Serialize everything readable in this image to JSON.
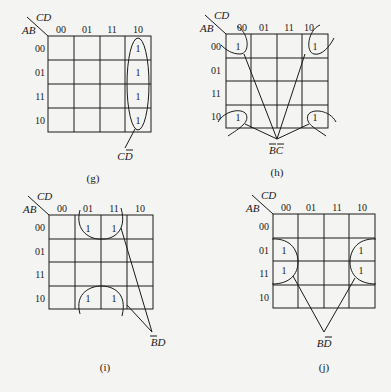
{
  "figure": {
    "maps": [
      {
        "id": "g",
        "caption": "(g)",
        "row_var": "AB",
        "col_var": "CD",
        "col_labels": [
          "00",
          "01",
          "11",
          "10"
        ],
        "row_labels": [
          "00",
          "01",
          "11",
          "10"
        ],
        "cells": [
          [
            0,
            0,
            0,
            1
          ],
          [
            0,
            0,
            0,
            1
          ],
          [
            0,
            0,
            0,
            1
          ],
          [
            0,
            0,
            0,
            1
          ]
        ],
        "one_label": "1",
        "group_term": "CD̄",
        "group_term_main": "CD",
        "group_term_bar": "D"
      },
      {
        "id": "h",
        "caption": "(h)",
        "row_var": "AB",
        "col_var": "CD",
        "col_labels": [
          "00",
          "01",
          "11",
          "10"
        ],
        "row_labels": [
          "00",
          "01",
          "11",
          "10"
        ],
        "cells": [
          [
            1,
            0,
            0,
            1
          ],
          [
            0,
            0,
            0,
            0
          ],
          [
            0,
            0,
            0,
            0
          ],
          [
            1,
            0,
            0,
            1
          ]
        ],
        "one_label": "1",
        "group_term": "B̄C̄",
        "group_term_main": "BC"
      },
      {
        "id": "i",
        "caption": "(i)",
        "row_var": "AB",
        "col_var": "CD",
        "col_labels": [
          "00",
          "01",
          "11",
          "10"
        ],
        "row_labels": [
          "00",
          "01",
          "11",
          "10"
        ],
        "cells": [
          [
            0,
            1,
            1,
            0
          ],
          [
            0,
            0,
            0,
            0
          ],
          [
            0,
            0,
            0,
            0
          ],
          [
            0,
            1,
            1,
            0
          ]
        ],
        "one_label": "1",
        "group_term": "B̄D",
        "group_term_main": "BD"
      },
      {
        "id": "j",
        "caption": "(j)",
        "row_var": "AB",
        "col_var": "CD",
        "col_labels": [
          "00",
          "01",
          "11",
          "10"
        ],
        "row_labels": [
          "00",
          "01",
          "11",
          "10"
        ],
        "cells": [
          [
            0,
            0,
            0,
            0
          ],
          [
            1,
            0,
            0,
            1
          ],
          [
            1,
            0,
            0,
            1
          ],
          [
            0,
            0,
            0,
            0
          ]
        ],
        "one_label": "1",
        "group_term": "BD̄",
        "group_term_main": "BD"
      }
    ]
  }
}
